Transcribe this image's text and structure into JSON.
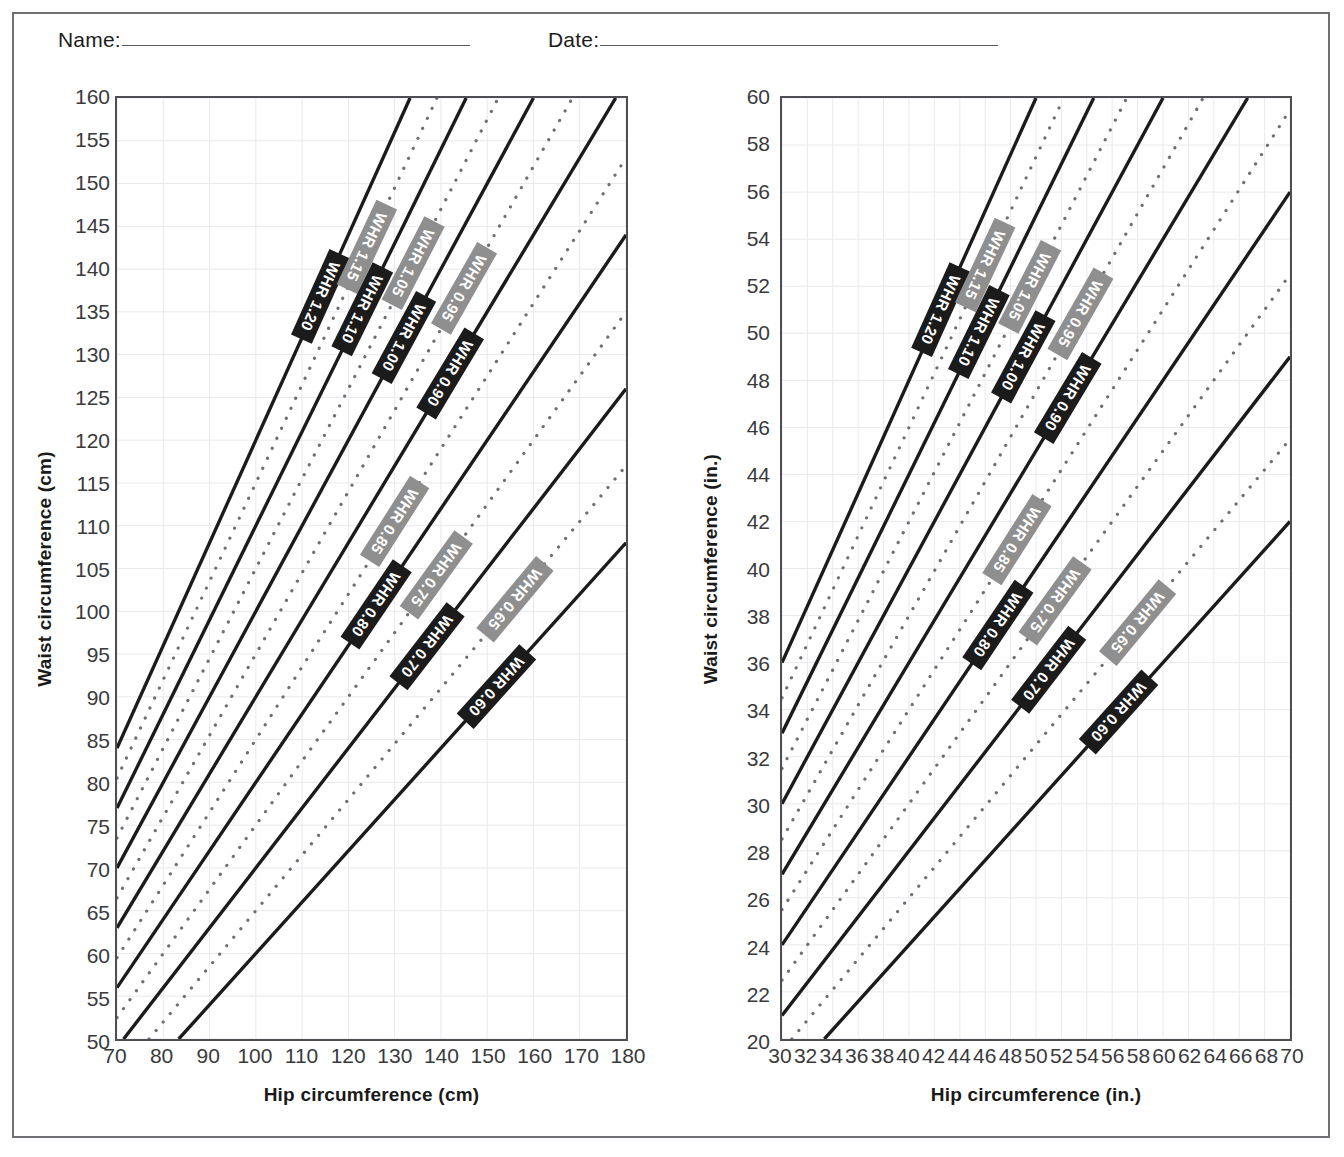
{
  "form": {
    "name_label": "Name:",
    "date_label": "Date:",
    "name_value": "",
    "date_value": ""
  },
  "charts": [
    {
      "id": "cm",
      "xlabel": "Hip circumference (cm)",
      "ylabel": "Waist circumference (cm)",
      "xticks": [
        70,
        80,
        90,
        100,
        110,
        120,
        130,
        140,
        150,
        160,
        170,
        180
      ],
      "yticks": [
        160,
        155,
        150,
        145,
        140,
        135,
        130,
        125,
        120,
        115,
        110,
        105,
        100,
        95,
        90,
        85,
        80,
        75,
        70,
        65,
        60,
        55,
        50
      ]
    },
    {
      "id": "in",
      "xlabel": "Hip circumference (in.)",
      "ylabel": "Waist circumference (in.)",
      "xticks": [
        30,
        32,
        34,
        36,
        38,
        40,
        42,
        44,
        46,
        48,
        50,
        52,
        54,
        56,
        58,
        60,
        62,
        64,
        66,
        68,
        70
      ],
      "yticks": [
        60,
        58,
        56,
        54,
        52,
        50,
        48,
        46,
        44,
        42,
        40,
        38,
        36,
        34,
        32,
        30,
        28,
        26,
        24,
        22,
        20
      ]
    }
  ],
  "chart_data": [
    {
      "type": "line",
      "id": "whr-nomogram-cm",
      "title": "",
      "xlabel": "Hip circumference (cm)",
      "ylabel": "Waist circumference (cm)",
      "xlim": [
        70,
        180
      ],
      "ylim": [
        50,
        160
      ],
      "xticks": [
        70,
        80,
        90,
        100,
        110,
        120,
        130,
        140,
        150,
        160,
        170,
        180
      ],
      "yticks": [
        50,
        55,
        60,
        65,
        70,
        75,
        80,
        85,
        90,
        95,
        100,
        105,
        110,
        115,
        120,
        125,
        130,
        135,
        140,
        145,
        150,
        155,
        160
      ],
      "grid": true,
      "legend": "inline-rotated-labels",
      "relation": "waist = WHR x hip",
      "series": [
        {
          "name": "WHR 1.20",
          "ratio": 1.2,
          "style": "solid",
          "label_color": "#1b1b1b",
          "label_text_color": "#ffffff",
          "label_at_hip": 114
        },
        {
          "name": "WHR 1.15",
          "ratio": 1.15,
          "style": "dotted",
          "label_color": "#8f8f8f",
          "label_text_color": "#ffffff",
          "label_at_hip": 124
        },
        {
          "name": "WHR 1.10",
          "ratio": 1.1,
          "style": "solid",
          "label_color": "#1b1b1b",
          "label_text_color": "#ffffff",
          "label_at_hip": 123
        },
        {
          "name": "WHR 1.05",
          "ratio": 1.05,
          "style": "dotted",
          "label_color": "#8f8f8f",
          "label_text_color": "#ffffff",
          "label_at_hip": 134
        },
        {
          "name": "WHR 1.00",
          "ratio": 1.0,
          "style": "solid",
          "label_color": "#1b1b1b",
          "label_text_color": "#ffffff",
          "label_at_hip": 132
        },
        {
          "name": "WHR 0.95",
          "ratio": 0.95,
          "style": "dotted",
          "label_color": "#8f8f8f",
          "label_text_color": "#ffffff",
          "label_at_hip": 145
        },
        {
          "name": "WHR 0.90",
          "ratio": 0.9,
          "style": "solid",
          "label_color": "#1b1b1b",
          "label_text_color": "#ffffff",
          "label_at_hip": 142
        },
        {
          "name": "WHR 0.85",
          "ratio": 0.85,
          "style": "dotted",
          "label_color": "#8f8f8f",
          "label_text_color": "#ffffff",
          "label_at_hip": 130
        },
        {
          "name": "WHR 0.80",
          "ratio": 0.8,
          "style": "solid",
          "label_color": "#1b1b1b",
          "label_text_color": "#ffffff",
          "label_at_hip": 126
        },
        {
          "name": "WHR 0.75",
          "ratio": 0.75,
          "style": "dotted",
          "label_color": "#8f8f8f",
          "label_text_color": "#ffffff",
          "label_at_hip": 139
        },
        {
          "name": "WHR 0.70",
          "ratio": 0.7,
          "style": "solid",
          "label_color": "#1b1b1b",
          "label_text_color": "#ffffff",
          "label_at_hip": 137
        },
        {
          "name": "WHR 0.65",
          "ratio": 0.65,
          "style": "dotted",
          "label_color": "#8f8f8f",
          "label_text_color": "#ffffff",
          "label_at_hip": 156
        },
        {
          "name": "WHR 0.60",
          "ratio": 0.6,
          "style": "solid",
          "label_color": "#1b1b1b",
          "label_text_color": "#ffffff",
          "label_at_hip": 152
        }
      ]
    },
    {
      "type": "line",
      "id": "whr-nomogram-in",
      "title": "",
      "xlabel": "Hip circumference (in.)",
      "ylabel": "Waist circumference (in.)",
      "xlim": [
        30,
        70
      ],
      "ylim": [
        20,
        60
      ],
      "xticks": [
        30,
        32,
        34,
        36,
        38,
        40,
        42,
        44,
        46,
        48,
        50,
        52,
        54,
        56,
        58,
        60,
        62,
        64,
        66,
        68,
        70
      ],
      "yticks": [
        20,
        22,
        24,
        26,
        28,
        30,
        32,
        34,
        36,
        38,
        40,
        42,
        44,
        46,
        48,
        50,
        52,
        54,
        56,
        58,
        60
      ],
      "grid": true,
      "legend": "inline-rotated-labels",
      "relation": "waist = WHR x hip",
      "series": [
        {
          "name": "WHR 1.20",
          "ratio": 1.2,
          "style": "solid",
          "label_color": "#1b1b1b",
          "label_text_color": "#ffffff",
          "label_at_hip": 42.5
        },
        {
          "name": "WHR 1.15",
          "ratio": 1.15,
          "style": "dotted",
          "label_color": "#8f8f8f",
          "label_text_color": "#ffffff",
          "label_at_hip": 46.0
        },
        {
          "name": "WHR 1.10",
          "ratio": 1.1,
          "style": "solid",
          "label_color": "#1b1b1b",
          "label_text_color": "#ffffff",
          "label_at_hip": 45.5
        },
        {
          "name": "WHR 1.05",
          "ratio": 1.05,
          "style": "dotted",
          "label_color": "#8f8f8f",
          "label_text_color": "#ffffff",
          "label_at_hip": 49.5
        },
        {
          "name": "WHR 1.00",
          "ratio": 1.0,
          "style": "solid",
          "label_color": "#1b1b1b",
          "label_text_color": "#ffffff",
          "label_at_hip": 49.0
        },
        {
          "name": "WHR 0.95",
          "ratio": 0.95,
          "style": "dotted",
          "label_color": "#8f8f8f",
          "label_text_color": "#ffffff",
          "label_at_hip": 53.5
        },
        {
          "name": "WHR 0.90",
          "ratio": 0.9,
          "style": "solid",
          "label_color": "#1b1b1b",
          "label_text_color": "#ffffff",
          "label_at_hip": 52.5
        },
        {
          "name": "WHR 0.85",
          "ratio": 0.85,
          "style": "dotted",
          "label_color": "#8f8f8f",
          "label_text_color": "#ffffff",
          "label_at_hip": 48.5
        },
        {
          "name": "WHR 0.80",
          "ratio": 0.8,
          "style": "solid",
          "label_color": "#1b1b1b",
          "label_text_color": "#ffffff",
          "label_at_hip": 47.0
        },
        {
          "name": "WHR 0.75",
          "ratio": 0.75,
          "style": "dotted",
          "label_color": "#8f8f8f",
          "label_text_color": "#ffffff",
          "label_at_hip": 51.5
        },
        {
          "name": "WHR 0.70",
          "ratio": 0.7,
          "style": "solid",
          "label_color": "#1b1b1b",
          "label_text_color": "#ffffff",
          "label_at_hip": 51.0
        },
        {
          "name": "WHR 0.65",
          "ratio": 0.65,
          "style": "dotted",
          "label_color": "#8f8f8f",
          "label_text_color": "#ffffff",
          "label_at_hip": 58.0
        },
        {
          "name": "WHR 0.60",
          "ratio": 0.6,
          "style": "solid",
          "label_color": "#1b1b1b",
          "label_text_color": "#ffffff",
          "label_at_hip": 56.5
        }
      ]
    }
  ],
  "colors": {
    "solid_line": "#1b1b1b",
    "dotted_line": "#6e6e73",
    "grid": "#e9e9ee",
    "axis": "#4e4e53",
    "frame": "#6f6f74",
    "label_black": "#1b1b1b",
    "label_gray": "#8f8f8f",
    "label_text": "#ffffff"
  }
}
